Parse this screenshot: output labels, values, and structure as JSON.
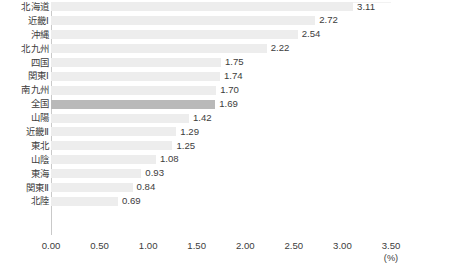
{
  "chart_data": {
    "type": "bar",
    "orientation": "horizontal",
    "title": "",
    "subtitle": "",
    "xlabel": "(%)",
    "ylabel": "",
    "xlim": [
      0.0,
      3.5
    ],
    "xticks": [
      "0.00",
      "0.50",
      "1.00",
      "1.50",
      "2.00",
      "2.50",
      "3.00",
      "3.50"
    ],
    "xtick_values": [
      0.0,
      0.5,
      1.0,
      1.5,
      2.0,
      2.5,
      3.0,
      3.5
    ],
    "grid": false,
    "legend": false,
    "categories": [
      "北海道",
      "近畿Ⅰ",
      "沖縄",
      "北九州",
      "四国",
      "関東Ⅰ",
      "南九州",
      "全国",
      "山陽",
      "近畿Ⅱ",
      "東北",
      "山陰",
      "東海",
      "関東Ⅱ",
      "北陸"
    ],
    "values": [
      3.11,
      2.72,
      2.54,
      2.22,
      1.75,
      1.74,
      1.7,
      1.69,
      1.42,
      1.29,
      1.25,
      1.08,
      0.93,
      0.84,
      0.69
    ],
    "value_labels": [
      "3.11",
      "2.72",
      "2.54",
      "2.22",
      "1.75",
      "1.74",
      "1.70",
      "1.69",
      "1.42",
      "1.29",
      "1.25",
      "1.08",
      "0.93",
      "0.84",
      "0.69"
    ],
    "highlight_category": "全国",
    "highlight_index": 7,
    "colors": {
      "bar": "#ededed",
      "bar_highlight": "#b9b9b9",
      "axis": "#c9c9c9",
      "text": "#3c3c3c",
      "background": "#ffffff"
    }
  },
  "axis": {
    "unit": "(%)"
  }
}
